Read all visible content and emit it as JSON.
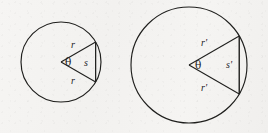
{
  "figure": {
    "background_color": "#f4f3f1",
    "stroke_color": "#1f1f1d",
    "text_color": "#20201e"
  },
  "circles": [
    {
      "id": "small-circle",
      "name": "small-circle",
      "center_x": 61,
      "center_y": 62,
      "radius": 40,
      "radius_label": "r",
      "arc_label": "s",
      "angle_label": "θ",
      "angle_degrees": 60
    },
    {
      "id": "large-circle",
      "name": "large-circle",
      "center_x": 189,
      "center_y": 65,
      "radius": 58,
      "radius_label": "r'",
      "arc_label": "s'",
      "angle_label": "θ",
      "angle_degrees": 60
    }
  ],
  "labels": {
    "small": {
      "radius_upper": "r",
      "radius_lower": "r",
      "arc": "s",
      "angle": "θ"
    },
    "large": {
      "radius_upper": "r'",
      "radius_lower": "r'",
      "arc": "s'",
      "angle": "θ"
    }
  }
}
